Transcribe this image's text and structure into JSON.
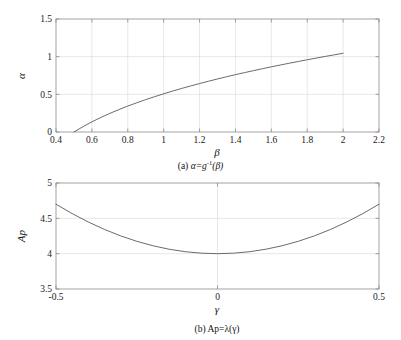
{
  "figure": {
    "name": "two-panel-function-plot",
    "background_color": "#ffffff",
    "axis_color": "#8c8c8c",
    "grid_color": "#d9d9d9",
    "curve_color": "#5a5a5a"
  },
  "panel_a": {
    "caption_prefix": "(a)",
    "caption_body": "α=g",
    "caption_sup": "-1",
    "caption_tail": "(β)",
    "caption_full": "(a) α=g⁻¹(β)",
    "xlabel": "β",
    "ylabel": "α",
    "xticks": [
      "0.4",
      "0.6",
      "0.8",
      "1",
      "1.2",
      "1.4",
      "1.6",
      "1.8",
      "2",
      "2.2"
    ],
    "yticks": [
      "0",
      "0.5",
      "1",
      "1.5"
    ]
  },
  "panel_b": {
    "caption_prefix": "(b)",
    "caption_body": "Ap=λ(γ)",
    "caption_full": "(b) Ap=λ(γ)",
    "xlabel": "γ",
    "ylabel": "Ap",
    "xticks": [
      "-0.5",
      "0",
      "0.5"
    ],
    "yticks": [
      "3.5",
      "4",
      "4.5",
      "5"
    ]
  },
  "chart_data": [
    {
      "type": "line",
      "panel": "a",
      "title": "(a) α=g⁻¹(β)",
      "xlabel": "β",
      "ylabel": "α",
      "xlim": [
        0.4,
        2.2
      ],
      "ylim": [
        0.0,
        1.5
      ],
      "xticks": [
        0.4,
        0.6,
        0.8,
        1.0,
        1.2,
        1.4,
        1.6,
        1.8,
        2.0,
        2.2
      ],
      "yticks": [
        0.0,
        0.5,
        1.0,
        1.5
      ],
      "grid": true,
      "legend": null,
      "series": [
        {
          "name": "α=g⁻¹(β)",
          "color": "#5a5a5a",
          "x": [
            0.5,
            0.55,
            0.6,
            0.65,
            0.7,
            0.75,
            0.8,
            0.85,
            0.9,
            0.95,
            1.0,
            1.05,
            1.1,
            1.15,
            1.2,
            1.25,
            1.3,
            1.35,
            1.4,
            1.45,
            1.5,
            1.55,
            1.6,
            1.65,
            1.7,
            1.75,
            1.8,
            1.85,
            1.9,
            1.95,
            2.0
          ],
          "y": [
            0.0,
            0.07,
            0.135,
            0.193,
            0.247,
            0.297,
            0.344,
            0.388,
            0.43,
            0.469,
            0.507,
            0.543,
            0.578,
            0.611,
            0.643,
            0.674,
            0.704,
            0.733,
            0.761,
            0.788,
            0.814,
            0.84,
            0.865,
            0.889,
            0.913,
            0.936,
            0.959,
            0.981,
            1.003,
            1.024,
            1.045
          ]
        }
      ]
    },
    {
      "type": "line",
      "panel": "b",
      "title": "(b) Ap=λ(γ)",
      "xlabel": "γ",
      "ylabel": "Ap",
      "xlim": [
        -0.5,
        0.5
      ],
      "ylim": [
        3.5,
        5.0
      ],
      "xticks": [
        -0.5,
        0,
        0.5
      ],
      "yticks": [
        3.5,
        4.0,
        4.5,
        5.0
      ],
      "grid": true,
      "legend": null,
      "series": [
        {
          "name": "Ap=λ(γ)",
          "color": "#5a5a5a",
          "x": [
            -0.5,
            -0.45,
            -0.4,
            -0.35,
            -0.3,
            -0.25,
            -0.2,
            -0.15,
            -0.1,
            -0.05,
            0.0,
            0.05,
            0.1,
            0.15,
            0.2,
            0.25,
            0.3,
            0.35,
            0.4,
            0.45,
            0.5
          ],
          "y": [
            4.7,
            4.567,
            4.448,
            4.343,
            4.252,
            4.175,
            4.112,
            4.063,
            4.028,
            4.007,
            4.0,
            4.007,
            4.028,
            4.063,
            4.112,
            4.175,
            4.252,
            4.343,
            4.448,
            4.567,
            4.7
          ]
        }
      ]
    }
  ]
}
